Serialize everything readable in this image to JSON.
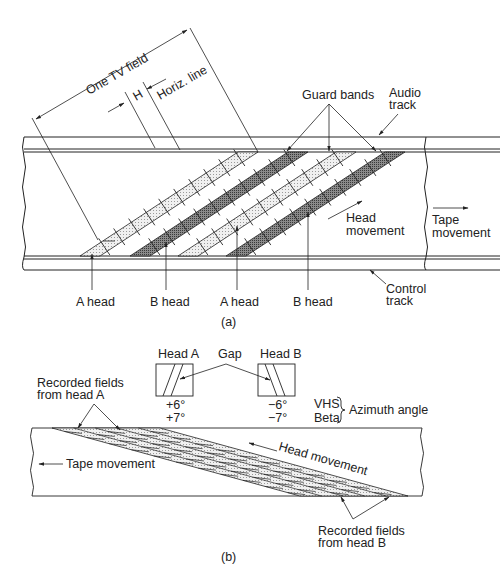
{
  "figure_a": {
    "caption": "(a)",
    "labels": {
      "one_tv_field": "One TV field",
      "h": "H",
      "horiz_line": "Horiz. line",
      "guard_bands": "Guard bands",
      "audio_track_1": "Audio",
      "audio_track_2": "track",
      "head_movement_1": "Head",
      "head_movement_2": "movement",
      "tape_movement_1": "Tape",
      "tape_movement_2": "movement",
      "control_track_1": "Control",
      "control_track_2": "track",
      "a_head_1": "A head",
      "b_head_1": "B head",
      "a_head_2": "A head",
      "b_head_2": "B head"
    }
  },
  "figure_b": {
    "caption": "(b)",
    "labels": {
      "head_a": "Head A",
      "head_b": "Head B",
      "gap": "Gap",
      "head_a_vhs": "+6°",
      "head_a_beta": "+7°",
      "head_b_vhs": "−6°",
      "head_b_beta": "−7°",
      "vhs": "VHS",
      "beta": "Beta",
      "azimuth_angle": "Azimuth angle",
      "recorded_a_1": "Recorded fields",
      "recorded_a_2": "from head A",
      "recorded_b_1": "Recorded fields",
      "recorded_b_2": "from head B",
      "tape_movement": "Tape movement",
      "head_movement": "Head movement"
    }
  },
  "colors": {
    "line": "#222222",
    "light_fill": "#e2e2e2",
    "dark_fill": "#7a7a7a"
  }
}
